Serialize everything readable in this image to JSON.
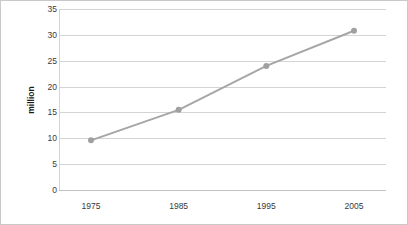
{
  "chart_data": {
    "type": "line",
    "title": "",
    "xlabel": "",
    "ylabel": "million",
    "categories": [
      "1975",
      "1985",
      "1995",
      "2005"
    ],
    "x": [
      1975,
      1985,
      1995,
      2005
    ],
    "values": [
      9.6,
      15.5,
      24.0,
      30.8
    ],
    "series": [
      {
        "name": "million",
        "values": [
          9.6,
          15.5,
          24.0,
          30.8
        ]
      }
    ],
    "ylim": [
      0,
      35
    ],
    "yticks": [
      0,
      5,
      10,
      15,
      20,
      25,
      30,
      35
    ],
    "ytick_labels": [
      "0",
      "5",
      "10",
      "15",
      "20",
      "25",
      "30",
      "35"
    ],
    "xtick_labels": [
      "1975",
      "1985",
      "1995",
      "2005"
    ],
    "grid": "horizontal",
    "legend": "none",
    "marker": "circle",
    "colors": {
      "line": "#a6a6a6",
      "marker": "#a0a0a0",
      "grid": "#d4d4d4",
      "tick_text": "#3a3a3a",
      "axis_title": "#1a1a1a",
      "background": "#ffffff",
      "border": "#c9c9c9"
    }
  }
}
